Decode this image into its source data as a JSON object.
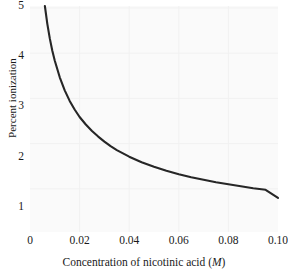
{
  "chart_data": {
    "type": "line",
    "title": "",
    "xlabel": "Concentration of nicotinic acid (M)",
    "xlabel_plain": "Concentration of nicotinic acid (",
    "xlabel_italic": "M",
    "xlabel_tail": ")",
    "ylabel": "Percent ionization",
    "xlim": [
      0,
      0.1
    ],
    "ylim": [
      0.5,
      5.0
    ],
    "grid": true,
    "legend": "none",
    "line_color": "#262626",
    "plot_background": "#fafafa",
    "grid_color": "#f0f0f0",
    "xticks": [
      0,
      0.02,
      0.04,
      0.06,
      0.08,
      0.1
    ],
    "xtick_labels": [
      "0",
      "0.02",
      "0.04",
      "0.06",
      "0.08",
      "0.10"
    ],
    "yticks": [
      1,
      2,
      3,
      4,
      5
    ],
    "ytick_labels": [
      "1",
      "2",
      "3",
      "4",
      "5"
    ],
    "x": [
      0.006,
      0.007,
      0.008,
      0.009,
      0.01,
      0.012,
      0.014,
      0.016,
      0.018,
      0.02,
      0.0225,
      0.025,
      0.0275,
      0.03,
      0.0325,
      0.035,
      0.04,
      0.045,
      0.05,
      0.055,
      0.06,
      0.065,
      0.07,
      0.075,
      0.08,
      0.085,
      0.09,
      0.095,
      0.1
    ],
    "values": [
      5.0,
      4.64,
      4.35,
      4.11,
      3.91,
      3.58,
      3.32,
      3.11,
      2.94,
      2.79,
      2.64,
      2.51,
      2.4,
      2.3,
      2.21,
      2.13,
      2.0,
      1.89,
      1.8,
      1.72,
      1.65,
      1.59,
      1.54,
      1.49,
      1.45,
      1.41,
      1.37,
      1.34,
      1.18
    ],
    "series": [
      {
        "name": "Percent ionization",
        "values": [
          5.0,
          4.64,
          4.35,
          4.11,
          3.91,
          3.58,
          3.32,
          3.11,
          2.94,
          2.79,
          2.64,
          2.51,
          2.4,
          2.3,
          2.21,
          2.13,
          2.0,
          1.89,
          1.8,
          1.72,
          1.65,
          1.59,
          1.54,
          1.49,
          1.45,
          1.41,
          1.37,
          1.34,
          1.18
        ]
      }
    ]
  }
}
